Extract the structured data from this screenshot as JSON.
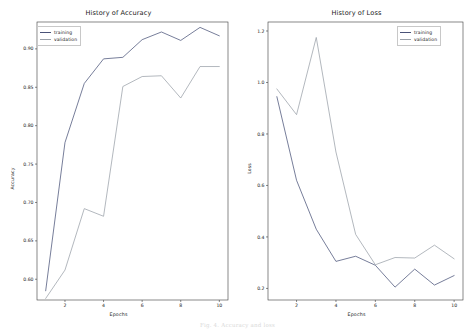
{
  "figure": {
    "caption": "Fig. 4. Accuracy and loss"
  },
  "colors": {
    "training": "#4a5378",
    "validation": "#9aa0a8",
    "axis": "#3a3a3a",
    "text": "#1a1a1a"
  },
  "panels": {
    "accuracy": {
      "title": "History of Accuracy",
      "xlabel": "Epochs",
      "ylabel": "Accuracy",
      "legend": {
        "training_label": "training",
        "validation_label": "validation"
      },
      "xticks": [
        "2",
        "4",
        "6",
        "8",
        "10"
      ],
      "yticks": [
        "0.60",
        "0.65",
        "0.70",
        "0.75",
        "0.80",
        "0.85",
        "0.90"
      ]
    },
    "loss": {
      "title": "History of Loss",
      "xlabel": "Epochs",
      "ylabel": "Loss",
      "legend": {
        "training_label": "training",
        "validation_label": "validation"
      },
      "xticks": [
        "2",
        "4",
        "6",
        "8",
        "10"
      ],
      "yticks": [
        "0.2",
        "0.4",
        "0.6",
        "0.8",
        "1.0",
        "1.2"
      ]
    }
  },
  "chart_data": [
    {
      "type": "line",
      "title": "History of Accuracy",
      "xlabel": "Epochs",
      "ylabel": "Accuracy",
      "x": [
        1,
        2,
        3,
        4,
        5,
        6,
        7,
        8,
        9,
        10
      ],
      "xlim": [
        0.55,
        10.45
      ],
      "ylim": [
        0.573,
        0.935
      ],
      "xticks": [
        2,
        4,
        6,
        8,
        10
      ],
      "yticks": [
        0.6,
        0.65,
        0.7,
        0.75,
        0.8,
        0.85,
        0.9
      ],
      "grid": false,
      "legend_position": "upper left",
      "series": [
        {
          "name": "training",
          "color": "#4a5378",
          "values": [
            0.585,
            0.778,
            0.855,
            0.887,
            0.889,
            0.912,
            0.922,
            0.911,
            0.928,
            0.917
          ]
        },
        {
          "name": "validation",
          "color": "#9aa0a8",
          "values": [
            0.575,
            0.612,
            0.692,
            0.682,
            0.851,
            0.864,
            0.865,
            0.836,
            0.877,
            0.877
          ]
        }
      ]
    },
    {
      "type": "line",
      "title": "History of Loss",
      "xlabel": "Epochs",
      "ylabel": "Loss",
      "x": [
        1,
        2,
        3,
        4,
        5,
        6,
        7,
        8,
        9,
        10
      ],
      "xlim": [
        0.55,
        10.45
      ],
      "ylim": [
        0.155,
        1.235
      ],
      "xticks": [
        2,
        4,
        6,
        8,
        10
      ],
      "yticks": [
        0.2,
        0.4,
        0.6,
        0.8,
        1.0,
        1.2
      ],
      "grid": false,
      "legend_position": "upper right",
      "series": [
        {
          "name": "training",
          "color": "#4a5378",
          "values": [
            0.945,
            0.62,
            0.43,
            0.305,
            0.325,
            0.29,
            0.205,
            0.275,
            0.213,
            0.25
          ]
        },
        {
          "name": "validation",
          "color": "#9aa0a8",
          "values": [
            0.975,
            0.875,
            1.175,
            0.73,
            0.41,
            0.292,
            0.32,
            0.318,
            0.368,
            0.315
          ]
        }
      ]
    }
  ]
}
